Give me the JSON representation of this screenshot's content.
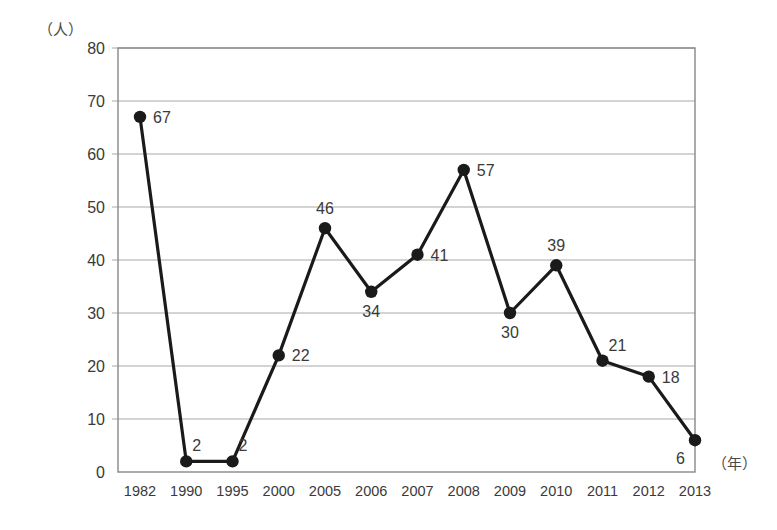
{
  "chart_data": {
    "type": "line",
    "title": "",
    "subtitle": "",
    "xlabel": "（年）",
    "ylabel": "（人）",
    "categories": [
      "1982",
      "1990",
      "1995",
      "2000",
      "2005",
      "2006",
      "2007",
      "2008",
      "2009",
      "2010",
      "2011",
      "2012",
      "2013"
    ],
    "values": [
      67,
      2,
      2,
      22,
      46,
      34,
      41,
      57,
      30,
      39,
      21,
      18,
      6
    ],
    "series": [
      {
        "name": "",
        "values": [
          67,
          2,
          2,
          22,
          46,
          34,
          41,
          57,
          30,
          39,
          21,
          18,
          6
        ]
      }
    ],
    "point_labels": [
      "67",
      "2",
      "2",
      "22",
      "46",
      "34",
      "41",
      "57",
      "30",
      "39",
      "21",
      "18",
      "6"
    ],
    "label_positions": [
      "right",
      "top-right",
      "top-right",
      "right",
      "top",
      "bottom",
      "right",
      "right",
      "bottom",
      "top",
      "top-right",
      "right",
      "bottom-left"
    ],
    "ylim": [
      0,
      80
    ],
    "ytick_values": [
      0,
      10,
      20,
      30,
      40,
      50,
      60,
      70,
      80
    ],
    "ytick_labels": [
      "0",
      "10",
      "20",
      "30",
      "40",
      "50",
      "60",
      "70",
      "80"
    ],
    "grid": true,
    "grid_axis": "y",
    "legend": false,
    "legend_position": "none",
    "marker": "circle",
    "line_color": "#1a1a1a",
    "marker_color": "#1a1a1a",
    "grid_color": "#a8a8a8",
    "axis_color": "#888888",
    "text_color": "#3a3a3a",
    "background_color": "#ffffff"
  }
}
